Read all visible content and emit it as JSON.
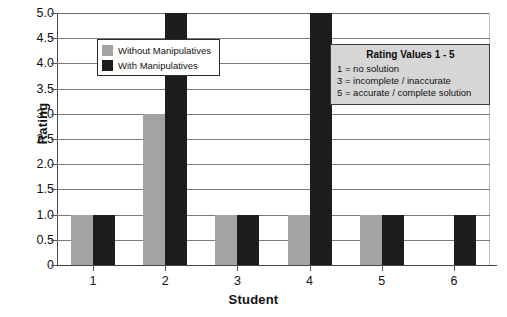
{
  "chart_data": {
    "type": "bar",
    "title": "",
    "xlabel": "Student",
    "ylabel": "Rating",
    "categories": [
      "1",
      "2",
      "3",
      "4",
      "5",
      "6"
    ],
    "series": [
      {
        "name": "Without Manipulatives",
        "color": "#a3a3a3",
        "values": [
          1,
          3,
          1,
          1,
          1,
          0
        ]
      },
      {
        "name": "With Manipulatives",
        "color": "#1c1c1c",
        "values": [
          1,
          5,
          1,
          5,
          1,
          1
        ]
      }
    ],
    "ylim": [
      0,
      5
    ],
    "ytick_labels": [
      "5.0",
      "4.5",
      "4.0",
      "3.5",
      "3.0",
      "2.5",
      "2.0",
      "1.5",
      "1.0",
      "0.5",
      "0"
    ],
    "ytick_values": [
      5.0,
      4.5,
      4.0,
      3.5,
      3.0,
      2.5,
      2.0,
      1.5,
      1.0,
      0.5,
      0
    ],
    "grid": true,
    "legend_position": "upper-left-inside"
  },
  "legend": {
    "entries": [
      {
        "label": "Without Manipulatives",
        "swatch": "without"
      },
      {
        "label": "With Manipulatives",
        "swatch": "with"
      }
    ]
  },
  "annotation": {
    "title": "Rating Values 1 - 5",
    "lines": [
      "1 = no solution",
      "3 = incomplete / inaccurate",
      "5 = accurate / complete solution"
    ]
  }
}
